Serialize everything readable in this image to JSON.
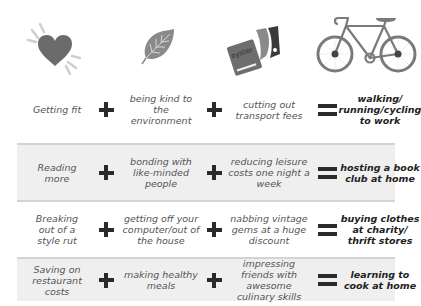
{
  "icons": [
    {
      "name": "heart-icon",
      "label": "heart"
    },
    {
      "name": "leaf-icon",
      "label": "leaf"
    },
    {
      "name": "transport-card-icon",
      "label": "oyster card",
      "card_text": "oyster"
    },
    {
      "name": "bicycle-icon",
      "label": "bicycle"
    }
  ],
  "operators": {
    "plus": "+",
    "equals": "="
  },
  "colors": {
    "band": "#efefef",
    "divider": "#d4d4d4",
    "operator": "#2a2a2a",
    "text": "#555555",
    "result_text": "#222222",
    "icon_gray": "#6b6b6b"
  },
  "rows": [
    {
      "benefit1": "Getting fit",
      "benefit2": "being kind to the environment",
      "benefit3": "cutting out transport fees",
      "result": "walking/ running/cycling to work"
    },
    {
      "benefit1": "Reading more",
      "benefit2": "bonding with like-minded people",
      "benefit3": "reducing leisure costs one night a week",
      "result": "hosting a book club at home"
    },
    {
      "benefit1": "Breaking out of a style rut",
      "benefit2": "getting off your computer/out of the house",
      "benefit3": "nabbing vintage gems at a huge discount",
      "result": "buying clothes at charity/ thrift stores"
    },
    {
      "benefit1": "Saving on restaurant costs",
      "benefit2": "making healthy meals",
      "benefit3": "impressing friends with awesome culinary skills",
      "result": "learning to cook at home"
    }
  ]
}
